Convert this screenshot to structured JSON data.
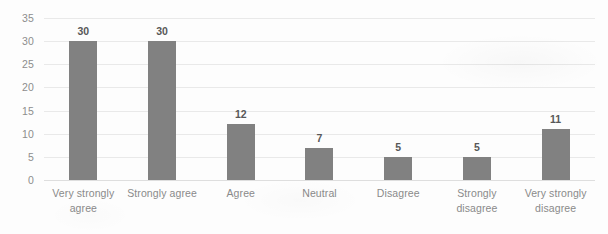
{
  "chart_data": {
    "type": "bar",
    "title": "",
    "subtitle": "",
    "xlabel": "",
    "ylabel": "",
    "categories": [
      "Very strongly agree",
      "Strongly agree",
      "Agree",
      "Neutral",
      "Disagree",
      "Strongly disagree",
      "Very strongly disagree"
    ],
    "values": [
      30,
      30,
      12,
      7,
      5,
      5,
      11
    ],
    "ylim": [
      0,
      35
    ],
    "yticks": [
      0,
      5,
      10,
      15,
      20,
      25,
      30,
      35
    ],
    "ytick_labels": [
      "0",
      "5",
      "10",
      "15",
      "20",
      "25",
      "30",
      "35"
    ],
    "data_labels": [
      "30",
      "30",
      "12",
      "7",
      "5",
      "5",
      "11"
    ],
    "grid": true,
    "grid_axis": "y",
    "legend": false,
    "legend_position": "none",
    "bar_color": "#818181",
    "grid_color": "#e9e9e9",
    "axis_text_color": "#8a8a8a",
    "data_label_color": "#585858",
    "background_color": "#fdfdfd"
  }
}
